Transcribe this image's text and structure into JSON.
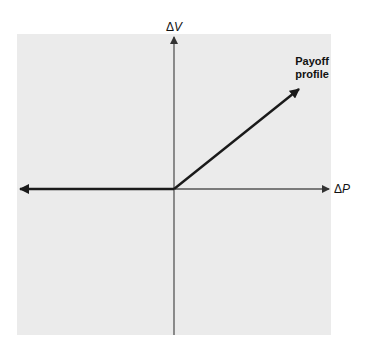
{
  "diagram": {
    "title_cutoff": "",
    "axes": {
      "x_label_symbol": "Δ",
      "x_label_var": "P",
      "y_label_symbol": "Δ",
      "y_label_var": "V"
    },
    "curve_label_line1": "Payoff",
    "curve_label_line2": "profile",
    "colors": {
      "panel": "#ebebeb",
      "axis": "#555555",
      "payoff_line": "#1a1a1a"
    }
  }
}
